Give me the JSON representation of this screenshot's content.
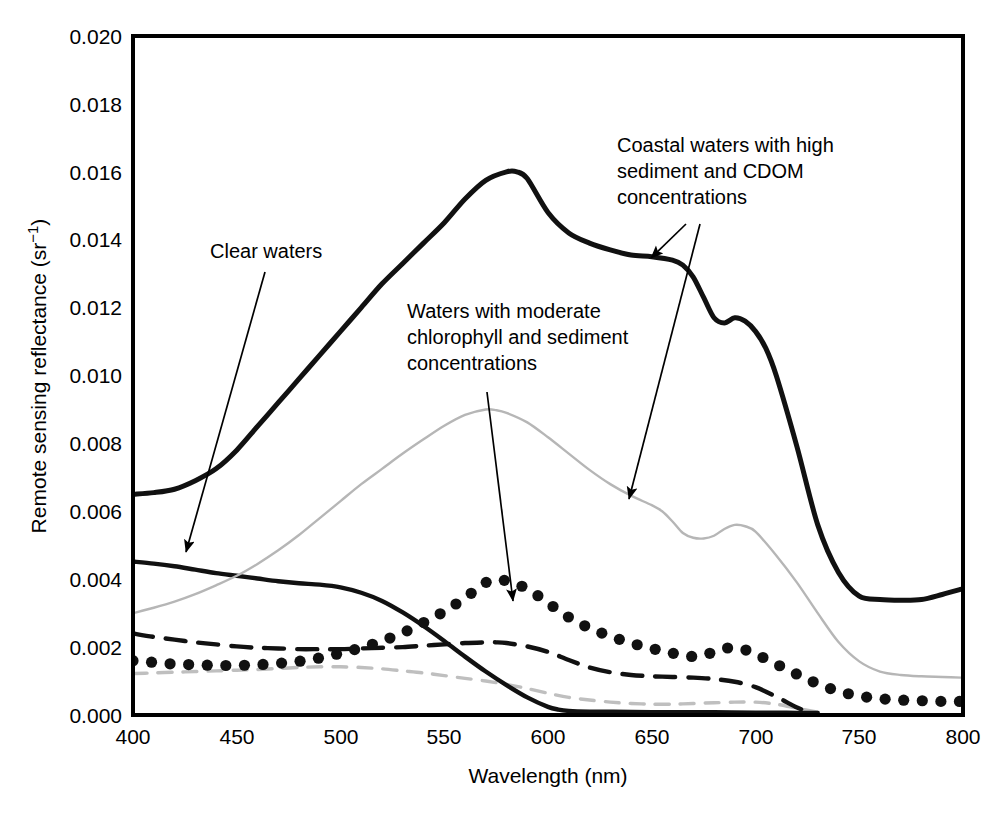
{
  "chart_data": {
    "type": "line",
    "title": "",
    "xlabel": "Wavelength (nm)",
    "ylabel": "Remote sensing reflectance (sr⁻¹)",
    "xlim": [
      400,
      800
    ],
    "ylim": [
      0.0,
      0.02
    ],
    "xticks": [
      400,
      450,
      500,
      550,
      600,
      650,
      700,
      750,
      800
    ],
    "xtick_labels": [
      "400",
      "450",
      "500",
      "550",
      "600",
      "650",
      "700",
      "750",
      "800"
    ],
    "yticks": [
      0.0,
      0.002,
      0.004,
      0.006,
      0.008,
      0.01,
      0.012,
      0.014,
      0.016,
      0.018,
      0.02
    ],
    "ytick_labels": [
      "0.000",
      "0.002",
      "0.004",
      "0.006",
      "0.008",
      "0.010",
      "0.012",
      "0.014",
      "0.016",
      "0.018",
      "0.020"
    ],
    "grid": false,
    "legend": "none",
    "legend_position": "annotations-with-arrows",
    "series": [
      {
        "name": "Coastal waters with high sediment and CDOM concentrations (thick solid)",
        "style": "solid",
        "color": "#111111",
        "width": 5,
        "x": [
          400,
          410,
          420,
          430,
          440,
          450,
          460,
          470,
          480,
          490,
          500,
          510,
          520,
          530,
          540,
          550,
          560,
          570,
          580,
          585,
          590,
          600,
          610,
          620,
          630,
          640,
          650,
          660,
          665,
          670,
          675,
          680,
          685,
          690,
          695,
          700,
          705,
          710,
          720,
          730,
          740,
          750,
          760,
          770,
          780,
          790,
          800
        ],
        "y": [
          0.0065,
          0.00655,
          0.00665,
          0.0069,
          0.00725,
          0.0078,
          0.0085,
          0.0092,
          0.0099,
          0.0106,
          0.0113,
          0.012,
          0.0127,
          0.0133,
          0.0139,
          0.0145,
          0.0152,
          0.01575,
          0.016,
          0.016,
          0.0158,
          0.0148,
          0.0142,
          0.0139,
          0.0137,
          0.01355,
          0.0135,
          0.0134,
          0.01325,
          0.0129,
          0.0123,
          0.0117,
          0.01155,
          0.0117,
          0.0116,
          0.0113,
          0.0108,
          0.01,
          0.0079,
          0.0056,
          0.0042,
          0.0035,
          0.0034,
          0.00338,
          0.0034,
          0.00355,
          0.00372
        ]
      },
      {
        "name": "Waters with moderate chlorophyll and sediment concentrations (thin gray solid)",
        "style": "solid",
        "color": "#b6b6b6",
        "width": 2.4,
        "x": [
          400,
          410,
          420,
          430,
          440,
          450,
          460,
          470,
          480,
          490,
          500,
          510,
          520,
          530,
          540,
          550,
          560,
          570,
          575,
          580,
          590,
          600,
          610,
          620,
          630,
          640,
          650,
          655,
          660,
          665,
          670,
          675,
          680,
          685,
          690,
          695,
          700,
          710,
          720,
          730,
          740,
          750,
          760,
          770,
          780,
          790,
          800
        ],
        "y": [
          0.003,
          0.00316,
          0.00334,
          0.00356,
          0.00382,
          0.0041,
          0.00445,
          0.00485,
          0.0053,
          0.0058,
          0.0063,
          0.0068,
          0.00725,
          0.0077,
          0.00812,
          0.00852,
          0.00884,
          0.009,
          0.00898,
          0.0089,
          0.00862,
          0.00818,
          0.0077,
          0.00722,
          0.0068,
          0.00646,
          0.00618,
          0.006,
          0.0057,
          0.00536,
          0.00522,
          0.0052,
          0.00528,
          0.00548,
          0.0056,
          0.00556,
          0.0054,
          0.0047,
          0.0039,
          0.003,
          0.00215,
          0.00158,
          0.00128,
          0.00118,
          0.00114,
          0.00112,
          0.0011
        ]
      },
      {
        "name": "Clear waters (thick solid, steep decline)",
        "style": "solid",
        "color": "#111111",
        "width": 4.4,
        "x": [
          400,
          410,
          420,
          430,
          440,
          450,
          460,
          470,
          480,
          490,
          500,
          510,
          520,
          530,
          540,
          550,
          560,
          570,
          580,
          590,
          600,
          605,
          610,
          620,
          640,
          660,
          680,
          700,
          710,
          720,
          730
        ],
        "y": [
          0.00452,
          0.00446,
          0.00438,
          0.00428,
          0.00418,
          0.0041,
          0.00402,
          0.00394,
          0.00388,
          0.00384,
          0.00376,
          0.0036,
          0.00336,
          0.00302,
          0.00262,
          0.00218,
          0.00172,
          0.00128,
          0.00088,
          0.00052,
          0.00024,
          0.00016,
          0.00012,
          0.0001,
          9e-05,
          8e-05,
          8e-05,
          7e-05,
          7e-05,
          6e-05,
          6e-05
        ]
      },
      {
        "name": "Dotted series (moderate chlorophyll / sediment, dotted)",
        "style": "dotted",
        "color": "#111111",
        "width": 5,
        "x": [
          400,
          410,
          420,
          430,
          440,
          450,
          460,
          470,
          480,
          490,
          500,
          510,
          520,
          530,
          540,
          550,
          560,
          570,
          575,
          580,
          590,
          600,
          610,
          620,
          630,
          640,
          650,
          660,
          670,
          675,
          680,
          685,
          690,
          695,
          700,
          710,
          720,
          730,
          740,
          750,
          760,
          770,
          780,
          790,
          800
        ],
        "y": [
          0.0016,
          0.00155,
          0.0015,
          0.00148,
          0.00146,
          0.00146,
          0.00148,
          0.00152,
          0.00158,
          0.00168,
          0.00182,
          0.00198,
          0.00218,
          0.00242,
          0.00272,
          0.00305,
          0.00345,
          0.0039,
          0.00398,
          0.00395,
          0.00372,
          0.0033,
          0.00288,
          0.00256,
          0.00232,
          0.00212,
          0.00196,
          0.00182,
          0.00172,
          0.00176,
          0.00186,
          0.00196,
          0.00198,
          0.00192,
          0.0018,
          0.0015,
          0.0012,
          0.00092,
          0.0007,
          0.00056,
          0.00048,
          0.00044,
          0.00042,
          0.0004,
          0.0004
        ]
      },
      {
        "name": "Dashed black series",
        "style": "dashed",
        "color": "#111111",
        "width": 4.4,
        "x": [
          400,
          410,
          420,
          430,
          440,
          450,
          460,
          470,
          480,
          490,
          500,
          510,
          520,
          530,
          540,
          550,
          560,
          570,
          575,
          580,
          590,
          600,
          610,
          620,
          630,
          640,
          650,
          660,
          670,
          680,
          690,
          700,
          710,
          715,
          720,
          725
        ],
        "y": [
          0.0024,
          0.0023,
          0.00222,
          0.00214,
          0.00208,
          0.00202,
          0.00198,
          0.00196,
          0.00194,
          0.00194,
          0.00194,
          0.00196,
          0.00198,
          0.002,
          0.00204,
          0.00208,
          0.00212,
          0.00214,
          0.00214,
          0.00212,
          0.00202,
          0.00186,
          0.00162,
          0.0014,
          0.00126,
          0.00118,
          0.00114,
          0.00112,
          0.0011,
          0.00106,
          0.00098,
          0.00082,
          0.00054,
          0.00038,
          0.00022,
          0.0001
        ]
      },
      {
        "name": "Dashed gray series",
        "style": "dashed",
        "color": "#bfbfbf",
        "width": 3.4,
        "x": [
          400,
          410,
          420,
          430,
          440,
          450,
          460,
          470,
          480,
          490,
          500,
          510,
          520,
          530,
          540,
          550,
          560,
          570,
          580,
          590,
          600,
          610,
          620,
          630,
          640,
          650,
          660,
          670,
          680,
          690,
          700,
          710,
          720,
          730
        ],
        "y": [
          0.00122,
          0.00124,
          0.00126,
          0.00128,
          0.0013,
          0.00132,
          0.00134,
          0.00137,
          0.0014,
          0.00142,
          0.00142,
          0.0014,
          0.00136,
          0.0013,
          0.00124,
          0.00116,
          0.00108,
          0.001,
          0.0009,
          0.00078,
          0.00064,
          0.00052,
          0.00044,
          0.00038,
          0.00034,
          0.00032,
          0.00032,
          0.00034,
          0.00036,
          0.00038,
          0.00038,
          0.00032,
          0.0002,
          8e-05
        ]
      }
    ],
    "annotations": [
      {
        "id": "clear-waters",
        "text_lines": [
          "Clear waters"
        ],
        "label_x": 210,
        "label_y": 258,
        "arrow_from": [
          265,
          272
        ],
        "arrow_to": [
          186,
          552
        ]
      },
      {
        "id": "moderate-chlorophyll",
        "text_lines": [
          "Waters with moderate",
          "chlorophyll and sediment",
          "concentrations"
        ],
        "label_x": 407,
        "label_y": 318,
        "arrow_from": [
          487,
          392
        ],
        "arrow_to": [
          513,
          601
        ]
      },
      {
        "id": "coastal-high-sediment-cdom",
        "text_lines": [
          "Coastal waters with high",
          "sediment and CDOM",
          "concentrations"
        ],
        "label_x": 617,
        "label_y": 152,
        "arrow_from": [
          686,
          224
        ],
        "arrow_to": [
          651,
          258
        ],
        "arrow2_from": [
          700,
          224
        ],
        "arrow2_to": [
          629,
          499
        ]
      }
    ]
  },
  "axes": {
    "x_title": "Wavelength (nm)",
    "y_title": "Remote sensing reflectance (sr⁻¹)",
    "y_title_main": "Remote sensing reflectance (sr",
    "y_title_exp": "−1",
    "y_title_close": ")"
  }
}
